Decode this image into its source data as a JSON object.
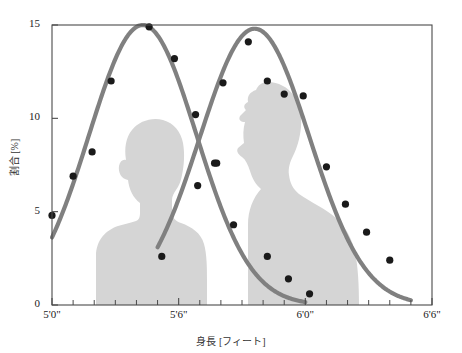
{
  "chart_data": {
    "type": "line",
    "title": "",
    "subtitle": "",
    "xlabel": "身長 [フィート]",
    "ylabel": "割合 [%]",
    "xlim": [
      60,
      78
    ],
    "ylim": [
      0,
      15
    ],
    "grid": false,
    "legend": "none",
    "x_tick_labels": [
      "5'0\"",
      "5'6\"",
      "6'0\"",
      "6'6\""
    ],
    "x_tick_values": [
      60,
      66,
      72,
      78
    ],
    "x_minor_tick_values": [
      61,
      62,
      63,
      64,
      65,
      67,
      68,
      69,
      70,
      71,
      73,
      74,
      75,
      76,
      77
    ],
    "y_tick_labels": [
      "0",
      "5",
      "10",
      "15"
    ],
    "y_tick_values": [
      0,
      5,
      10,
      15
    ],
    "annotations": [
      "female silhouette",
      "male silhouette"
    ],
    "series": [
      {
        "name": "female",
        "curve_type": "normal-fit",
        "color": "#808080",
        "marker_color": "#1a1a1a",
        "peak_x": 64.3,
        "peak_y": 15.0,
        "sigma": 2.55,
        "x": [
          60.0,
          61.0,
          62.0,
          63.0,
          64.0,
          65.0,
          66.0,
          67.0,
          68.0,
          69.0,
          70.0,
          71.0,
          72.0
        ],
        "y": [
          4.8,
          6.9,
          8.2,
          12.0,
          14.9,
          14.8,
          13.2,
          10.2,
          7.6,
          4.3,
          2.6,
          1.3,
          0.6
        ]
      },
      {
        "name": "male",
        "curve_type": "normal-fit",
        "color": "#808080",
        "marker_color": "#1a1a1a",
        "peak_x": 69.6,
        "peak_y": 14.8,
        "sigma": 2.6,
        "x": [
          65.0,
          66.0,
          67.0,
          68.0,
          69.0,
          70.0,
          71.0,
          72.0,
          73.0,
          74.0,
          75.0,
          76.0,
          77.0
        ],
        "y": [
          2.6,
          6.4,
          7.6,
          11.9,
          14.1,
          13.4,
          11.3,
          11.3,
          7.4,
          3.9,
          3.4,
          2.4,
          1.2
        ]
      }
    ],
    "scatter_points_female": [
      {
        "x": 60.0,
        "y": 4.8
      },
      {
        "x": 61.0,
        "y": 6.9
      },
      {
        "x": 61.9,
        "y": 8.2
      },
      {
        "x": 62.8,
        "y": 12.0
      },
      {
        "x": 64.6,
        "y": 14.9
      },
      {
        "x": 65.8,
        "y": 13.2
      },
      {
        "x": 66.8,
        "y": 10.2
      },
      {
        "x": 67.7,
        "y": 7.6
      },
      {
        "x": 68.6,
        "y": 4.3
      },
      {
        "x": 70.2,
        "y": 2.6
      },
      {
        "x": 71.2,
        "y": 1.4
      },
      {
        "x": 72.2,
        "y": 0.6
      }
    ],
    "scatter_points_male": [
      {
        "x": 65.2,
        "y": 2.6
      },
      {
        "x": 66.9,
        "y": 6.4
      },
      {
        "x": 67.8,
        "y": 7.6
      },
      {
        "x": 68.1,
        "y": 11.9
      },
      {
        "x": 69.3,
        "y": 14.1
      },
      {
        "x": 70.2,
        "y": 12.0
      },
      {
        "x": 71.0,
        "y": 11.3
      },
      {
        "x": 71.9,
        "y": 11.2
      },
      {
        "x": 73.0,
        "y": 7.4
      },
      {
        "x": 73.9,
        "y": 5.4
      },
      {
        "x": 74.9,
        "y": 3.9
      },
      {
        "x": 76.0,
        "y": 2.4
      }
    ]
  },
  "axes": {
    "y_label": "割合 [%]",
    "x_label": "身長 [フィート]",
    "y_ticks": [
      {
        "label": "15",
        "value": 15
      },
      {
        "label": "10",
        "value": 10
      },
      {
        "label": "5",
        "value": 5
      },
      {
        "label": "0",
        "value": 0
      }
    ],
    "x_ticks": [
      {
        "label": "5'0\"",
        "value": 60
      },
      {
        "label": "5'6\"",
        "value": 66
      },
      {
        "label": "6'0\"",
        "value": 72
      },
      {
        "label": "6'6\"",
        "value": 78
      }
    ]
  },
  "colors": {
    "curve": "#808080",
    "marker": "#1a1a1a",
    "silhouette": "#d5d5d5",
    "frame": "#4a4a4a",
    "text": "#222222",
    "background": "#ffffff"
  }
}
